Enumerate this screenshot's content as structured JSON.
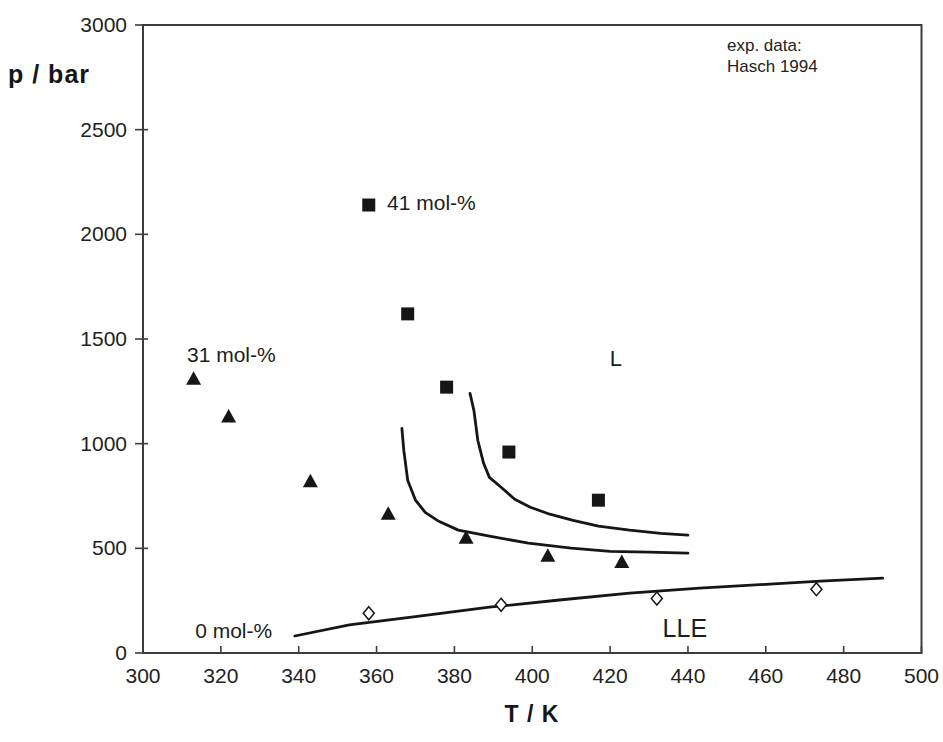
{
  "figure": {
    "background": "#ffffff",
    "ink_color": "#161616",
    "frame_color": "#3c3c3c"
  },
  "chart_data": {
    "type": "scatter",
    "title": "",
    "xlabel": "T / K",
    "ylabel": "p / bar",
    "xlim": [
      300,
      500
    ],
    "ylim": [
      0,
      3000
    ],
    "x_ticks": [
      300,
      320,
      340,
      360,
      380,
      400,
      420,
      440,
      460,
      480,
      500
    ],
    "y_ticks": [
      0,
      500,
      1000,
      1500,
      2000,
      2500,
      3000
    ],
    "grid": false,
    "legend": {
      "position": "top-right-inside",
      "lines": [
        "exp. data:",
        "Hasch 1994"
      ]
    },
    "series": [
      {
        "name": "41 mol-%",
        "marker": "filled-square",
        "points": [
          [
            358,
            2140
          ],
          [
            368,
            1620
          ],
          [
            378,
            1270
          ],
          [
            394,
            960
          ],
          [
            417,
            730
          ]
        ]
      },
      {
        "name": "31 mol-%",
        "marker": "filled-triangle",
        "points": [
          [
            313,
            1310
          ],
          [
            322,
            1130
          ],
          [
            343,
            820
          ],
          [
            363,
            665
          ],
          [
            383,
            550
          ],
          [
            404,
            465
          ],
          [
            423,
            435
          ]
        ]
      },
      {
        "name": "0 mol-%",
        "marker": "open-diamond",
        "points": [
          [
            358,
            190
          ],
          [
            392,
            230
          ],
          [
            432,
            260
          ],
          [
            473,
            305
          ]
        ]
      }
    ],
    "curves": [
      {
        "name": "model-curve-31-mol",
        "points": [
          [
            366.5,
            1073
          ],
          [
            367,
            968
          ],
          [
            368,
            825
          ],
          [
            370,
            730
          ],
          [
            372.5,
            672
          ],
          [
            376,
            629
          ],
          [
            381,
            587
          ],
          [
            389,
            558
          ],
          [
            399,
            525
          ],
          [
            410,
            501
          ],
          [
            420,
            486
          ],
          [
            430,
            482
          ],
          [
            440,
            477
          ]
        ]
      },
      {
        "name": "model-curve-41-mol",
        "points": [
          [
            384,
            1240
          ],
          [
            385,
            1159
          ],
          [
            386,
            1016
          ],
          [
            387.5,
            906
          ],
          [
            389,
            839
          ],
          [
            392,
            792
          ],
          [
            395.5,
            734
          ],
          [
            399.5,
            696
          ],
          [
            404.5,
            663
          ],
          [
            410.5,
            634
          ],
          [
            417,
            606
          ],
          [
            425,
            587
          ],
          [
            433,
            572
          ],
          [
            440,
            563
          ]
        ]
      },
      {
        "name": "lle-boundary-curve",
        "points": [
          [
            339,
            81
          ],
          [
            353,
            134
          ],
          [
            371,
            176
          ],
          [
            389,
            219
          ],
          [
            407,
            253
          ],
          [
            425,
            286
          ],
          [
            443,
            310
          ],
          [
            461,
            329
          ],
          [
            474,
            343
          ],
          [
            490,
            358
          ]
        ]
      }
    ],
    "annotations": [
      {
        "id": "series-label-41",
        "text": "41 mol-%",
        "t": 362.7,
        "p": 2150,
        "anchor": "start",
        "size": 21
      },
      {
        "id": "series-label-31",
        "text": "31 mol-%",
        "t": 311.3,
        "p": 1424,
        "anchor": "start",
        "size": 21
      },
      {
        "id": "series-label-0",
        "text": "0 mol-%",
        "t": 313.4,
        "p": 110,
        "anchor": "start",
        "size": 21
      },
      {
        "id": "region-label-L",
        "text": "L",
        "t": 421.5,
        "p": 1410,
        "anchor": "middle",
        "size": 22
      },
      {
        "id": "region-label-LLE",
        "text": "LLE",
        "t": 439.2,
        "p": 120,
        "anchor": "middle",
        "size": 25
      }
    ]
  }
}
